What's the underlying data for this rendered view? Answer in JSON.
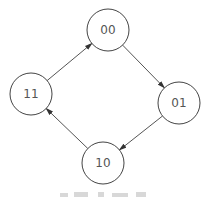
{
  "diagram": {
    "type": "state-transition-cycle",
    "colors": {
      "stroke": "#444444",
      "edge": "#555555",
      "label": "#555555",
      "background": "#ffffff"
    },
    "nodes": [
      {
        "id": "00",
        "label": "00",
        "cx": 108,
        "cy": 30,
        "r": 21
      },
      {
        "id": "01",
        "label": "01",
        "cx": 179,
        "cy": 103,
        "r": 21
      },
      {
        "id": "10",
        "label": "10",
        "cx": 103,
        "cy": 163,
        "r": 21
      },
      {
        "id": "11",
        "label": "11",
        "cx": 31,
        "cy": 94,
        "r": 21
      }
    ],
    "edges": [
      {
        "from": "00",
        "to": "01"
      },
      {
        "from": "01",
        "to": "10"
      },
      {
        "from": "10",
        "to": "11"
      },
      {
        "from": "11",
        "to": "00"
      }
    ]
  }
}
